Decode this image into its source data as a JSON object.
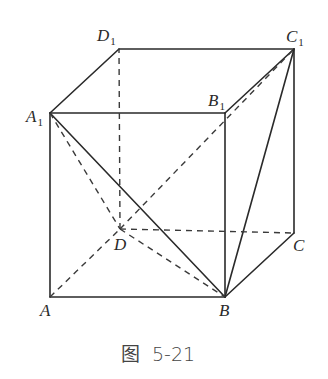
{
  "figure": {
    "caption": "图 5-21",
    "caption_parts": {
      "prefix": "图",
      "number": "5-21"
    },
    "vertices": {
      "A": {
        "label": "A",
        "sub": "",
        "x": 50,
        "y": 297
      },
      "B": {
        "label": "B",
        "sub": "",
        "x": 225,
        "y": 297
      },
      "C": {
        "label": "C",
        "sub": "",
        "x": 294,
        "y": 233
      },
      "D": {
        "label": "D",
        "sub": "",
        "x": 120,
        "y": 229
      },
      "A1": {
        "label": "A",
        "sub": "1",
        "x": 50,
        "y": 113
      },
      "B1": {
        "label": "B",
        "sub": "1",
        "x": 225,
        "y": 113
      },
      "C1": {
        "label": "C",
        "sub": "1",
        "x": 294,
        "y": 49
      },
      "D1": {
        "label": "D",
        "sub": "1",
        "x": 119,
        "y": 49
      }
    },
    "solid_edges": [
      [
        "A",
        "B"
      ],
      [
        "B",
        "C"
      ],
      [
        "C",
        "C1"
      ],
      [
        "A",
        "A1"
      ],
      [
        "B",
        "B1"
      ],
      [
        "A1",
        "B1"
      ],
      [
        "B1",
        "C1"
      ],
      [
        "C1",
        "D1"
      ],
      [
        "D1",
        "A1"
      ],
      [
        "A1",
        "B"
      ],
      [
        "B",
        "C1"
      ]
    ],
    "dashed_edges": [
      [
        "A",
        "D"
      ],
      [
        "D",
        "C"
      ],
      [
        "D",
        "D1"
      ],
      [
        "A1",
        "D"
      ],
      [
        "D",
        "B"
      ],
      [
        "D",
        "C1"
      ]
    ],
    "colors": {
      "line": "#2a2a2a",
      "background": "#ffffff",
      "caption": "#444444"
    }
  }
}
